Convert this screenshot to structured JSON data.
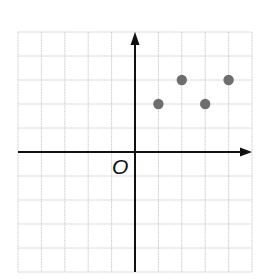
{
  "chart_data": {
    "type": "scatter",
    "title": "",
    "xlabel": "",
    "ylabel": "",
    "origin_label": "O",
    "xlim": [
      -5,
      5
    ],
    "ylim": [
      -5,
      5
    ],
    "grid": true,
    "grid_step": 1,
    "axes_arrows": [
      "positive-x",
      "positive-y"
    ],
    "points": [
      {
        "x": 1,
        "y": 2
      },
      {
        "x": 2,
        "y": 3
      },
      {
        "x": 3,
        "y": 2
      },
      {
        "x": 4,
        "y": 3
      }
    ],
    "colors": {
      "grid": "#d4d4d4",
      "axis": "#111111",
      "point": "#6e6e6e"
    }
  }
}
